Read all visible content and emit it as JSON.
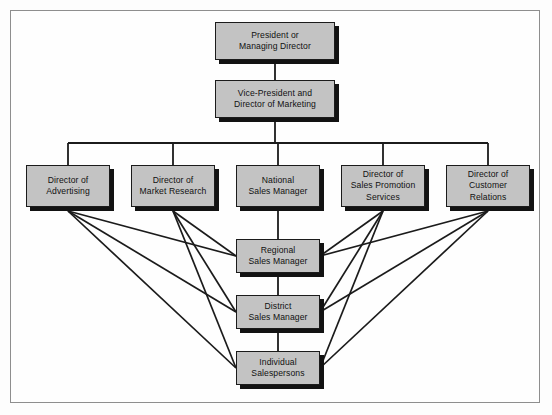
{
  "diagram": {
    "type": "org-chart",
    "frame": {
      "border_color": "#8e8e8e",
      "background": "#fefefe"
    },
    "style": {
      "box_fill": "#c3c3c3",
      "box_border": "#1b1b1b",
      "shadow_color": "#121212",
      "line_color": "#1b1b1b",
      "text_color": "#111111"
    }
  },
  "nodes": [
    {
      "id": "president",
      "label": "President or\nManaging Director",
      "level": 1,
      "x": 215,
      "y": 22,
      "w": 120,
      "h": 38
    },
    {
      "id": "vp_marketing",
      "label": "Vice-President and\nDirector of Marketing",
      "level": 2,
      "x": 215,
      "y": 80,
      "w": 120,
      "h": 38
    },
    {
      "id": "dir_advertising",
      "label": "Director of\nAdvertising",
      "level": 3,
      "x": 26,
      "y": 165,
      "w": 84,
      "h": 42
    },
    {
      "id": "dir_market_research",
      "label": "Director of\nMarket Research",
      "level": 3,
      "x": 131,
      "y": 165,
      "w": 84,
      "h": 42
    },
    {
      "id": "national_sales_manager",
      "label": "National\nSales Manager",
      "level": 3,
      "x": 236,
      "y": 165,
      "w": 84,
      "h": 42
    },
    {
      "id": "dir_sales_promotion",
      "label": "Director of\nSales Promotion\nServices",
      "level": 3,
      "x": 341,
      "y": 165,
      "w": 84,
      "h": 42
    },
    {
      "id": "dir_customer_relations",
      "label": "Director of\nCustomer\nRelations",
      "level": 3,
      "x": 446,
      "y": 165,
      "w": 84,
      "h": 42
    },
    {
      "id": "regional_sales_manager",
      "label": "Regional\nSales Manager",
      "level": 4,
      "x": 236,
      "y": 239,
      "w": 84,
      "h": 34
    },
    {
      "id": "district_sales_manager",
      "label": "District\nSales Manager",
      "level": 5,
      "x": 236,
      "y": 295,
      "w": 84,
      "h": 34
    },
    {
      "id": "individual_salespersons",
      "label": "Individual\nSalespersons",
      "level": 6,
      "x": 236,
      "y": 351,
      "w": 84,
      "h": 34
    }
  ],
  "edges": {
    "vertical_chain": [
      {
        "from": "president",
        "to": "vp_marketing",
        "style": "solid-line"
      },
      {
        "from": "national_sales_manager",
        "to": "regional_sales_manager",
        "style": "solid-line"
      },
      {
        "from": "regional_sales_manager",
        "to": "district_sales_manager",
        "style": "solid-line"
      },
      {
        "from": "district_sales_manager",
        "to": "individual_salespersons",
        "style": "solid-line"
      }
    ],
    "bus": {
      "from": "vp_marketing",
      "bus_y": 143,
      "to": [
        "dir_advertising",
        "dir_market_research",
        "national_sales_manager",
        "dir_sales_promotion",
        "dir_customer_relations"
      ],
      "style": "orthogonal-bus"
    },
    "staff_relations": [
      {
        "from": "dir_advertising",
        "to": "regional_sales_manager"
      },
      {
        "from": "dir_advertising",
        "to": "district_sales_manager"
      },
      {
        "from": "dir_advertising",
        "to": "individual_salespersons"
      },
      {
        "from": "dir_market_research",
        "to": "regional_sales_manager"
      },
      {
        "from": "dir_market_research",
        "to": "district_sales_manager"
      },
      {
        "from": "dir_market_research",
        "to": "individual_salespersons"
      },
      {
        "from": "dir_sales_promotion",
        "to": "regional_sales_manager"
      },
      {
        "from": "dir_sales_promotion",
        "to": "district_sales_manager"
      },
      {
        "from": "dir_sales_promotion",
        "to": "individual_salespersons"
      },
      {
        "from": "dir_customer_relations",
        "to": "regional_sales_manager"
      },
      {
        "from": "dir_customer_relations",
        "to": "district_sales_manager"
      },
      {
        "from": "dir_customer_relations",
        "to": "individual_salespersons"
      }
    ]
  }
}
